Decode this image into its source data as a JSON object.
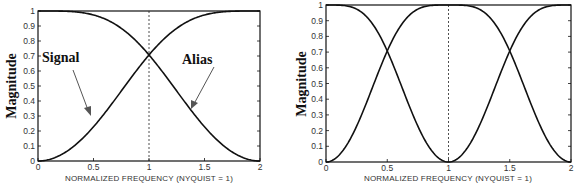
{
  "chart_data": [
    {
      "type": "line",
      "title": "",
      "xlabel": "NORMALIZED FREQUENCY (NYQUIST = 1)",
      "ylabel": "Magnitude",
      "xlim": [
        0,
        2
      ],
      "ylim": [
        0,
        1
      ],
      "xticks": [
        "0",
        "0.5",
        "1",
        "1.5",
        "2"
      ],
      "yticks": [
        "0",
        "0.1",
        "0.2",
        "0.3",
        "0.4",
        "0.5",
        "0.6",
        "0.7",
        "0.8",
        "0.9",
        "1"
      ],
      "grid": false,
      "vline": {
        "x": 1,
        "style": "dashed"
      },
      "annotations": [
        {
          "text": "Signal",
          "arrow_to": {
            "x": 0.5,
            "y": 0.3
          }
        },
        {
          "text": "Alias",
          "arrow_to": {
            "x": 1.4,
            "y": 0.35
          }
        }
      ],
      "x": [
        0,
        0.1,
        0.2,
        0.3,
        0.4,
        0.5,
        0.6,
        0.7,
        0.8,
        0.9,
        1.0,
        1.1,
        1.2,
        1.3,
        1.4,
        1.5,
        1.6,
        1.7,
        1.8,
        1.9,
        2.0
      ],
      "series": [
        {
          "name": "Signal",
          "values": [
            0,
            0.025,
            0.095,
            0.206,
            0.345,
            0.5,
            0.655,
            0.794,
            0.905,
            0.976,
            1,
            1,
            1,
            1,
            1,
            1,
            1,
            1,
            1,
            1,
            1
          ],
          "note": "rising from 0 at x=0 to 1 at x=2, crossing 0.707 at x=1"
        },
        {
          "name": "Alias",
          "values": [
            1,
            1,
            1,
            1,
            1,
            1,
            1,
            1,
            1,
            1,
            1,
            0.976,
            0.905,
            0.794,
            0.655,
            0.5,
            0.345,
            0.206,
            0.095,
            0.025,
            0
          ],
          "note": "falling from 1 at x=0 to 0 at x=2, crossing 0.707 at x=1"
        }
      ],
      "curves_exact": {
        "Signal": "sin(pi*x/4)",
        "Alias": "cos(pi*x/4)"
      }
    },
    {
      "type": "line",
      "title": "",
      "xlabel": "NORMALIZED FREQUENCY (NYQUIST = 1)",
      "ylabel": "Magnitude",
      "xlim": [
        0,
        2
      ],
      "ylim": [
        0,
        1
      ],
      "xticks": [
        "0",
        "0.5",
        "1",
        "1.5",
        "2"
      ],
      "yticks": [
        "0",
        "0.1",
        "0.2",
        "0.3",
        "0.4",
        "0.5",
        "0.6",
        "0.7",
        "0.8",
        "0.9",
        "1"
      ],
      "grid": false,
      "vline": {
        "x": 1,
        "style": "dashed"
      },
      "x": [
        0,
        0.25,
        0.5,
        0.75,
        1.0,
        1.25,
        1.5,
        1.75,
        2.0
      ],
      "series": [
        {
          "name": "Curve A",
          "values": [
            0,
            0.383,
            0.707,
            0.924,
            1,
            0.924,
            0.707,
            0.383,
            0
          ],
          "note": "rises 0->1 over 0..~0.85, flat, falls near 2 — |sin(pi*x/2)| shape peaking near 1"
        },
        {
          "name": "Curve B",
          "values": [
            1,
            0.924,
            0.707,
            0.383,
            0,
            0.383,
            0.707,
            0.924,
            1
          ],
          "note": "|cos(pi*x/2)|, crossing Curve A at 0.707 at x=0.5 and x=1.5"
        }
      ],
      "curves_exact": {
        "Curve A": "|sin(pi*x/2)|",
        "Curve B": "|cos(pi*x/2)|"
      }
    }
  ],
  "left_plot": {
    "ylabel": "Magnitude",
    "xlabel": "NORMALIZED FREQUENCY (NYQUIST = 1)",
    "xticks": [
      "0",
      "0.5",
      "1",
      "1.5",
      "2"
    ],
    "yticks": [
      "0",
      "0.1",
      "0.2",
      "0.3",
      "0.4",
      "0.5",
      "0.6",
      "0.7",
      "0.8",
      "0.9",
      "1"
    ],
    "signal_label": "Signal",
    "alias_label": "Alias"
  },
  "right_plot": {
    "ylabel": "Magnitude",
    "xlabel": "NORMALIZED FREQUENCY (NYQUIST = 1)",
    "xticks": [
      "0",
      "0.5",
      "1",
      "1.5",
      "2"
    ],
    "yticks": [
      "0",
      "0.1",
      "0.2",
      "0.3",
      "0.4",
      "0.5",
      "0.6",
      "0.7",
      "0.8",
      "0.9",
      "1"
    ]
  },
  "colors": {
    "line": "#111111",
    "arrow": "#555555",
    "frame": "#111111",
    "text": "#333333"
  }
}
